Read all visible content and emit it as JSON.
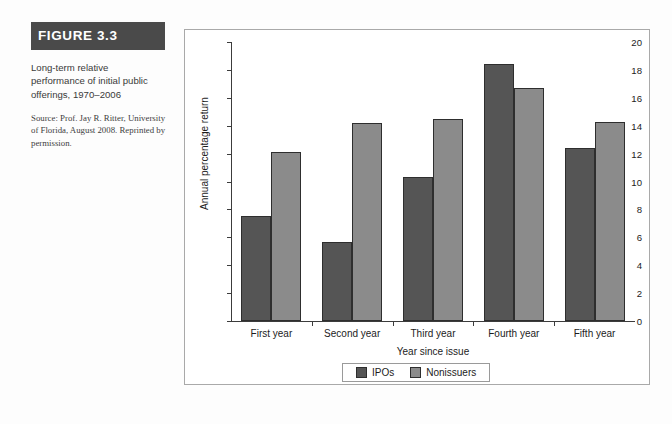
{
  "figure": {
    "header_label": "FIGURE 3.3",
    "caption": "Long-term relative performance of initial public offerings, 1970–2006",
    "source": "Source: Prof. Jay R. Ritter, University of Florida, August 2008. Reprinted by permission."
  },
  "colors": {
    "header_background": "#4a4a4a",
    "header_text": "#ffffff",
    "ipo_bar": "#555555",
    "nonissuer_bar": "#8b8b8b",
    "panel_border": "#a9a9a9",
    "axis": "#3c3c3c"
  },
  "chart_data": {
    "type": "bar",
    "title": "",
    "xlabel": "Year since issue",
    "ylabel": "Annual percentage return",
    "categories": [
      "First year",
      "Second year",
      "Third year",
      "Fourth year",
      "Fifth year"
    ],
    "series": [
      {
        "name": "IPOs",
        "values": [
          7.5,
          5.7,
          10.3,
          18.4,
          12.4
        ]
      },
      {
        "name": "Nonissuers",
        "values": [
          12.1,
          14.2,
          14.5,
          16.7,
          14.3
        ]
      }
    ],
    "ylim": [
      0,
      20
    ],
    "yticks": [
      0,
      2,
      4,
      6,
      8,
      10,
      12,
      14,
      16,
      18,
      20
    ],
    "grid": false,
    "legend_position": "bottom"
  }
}
